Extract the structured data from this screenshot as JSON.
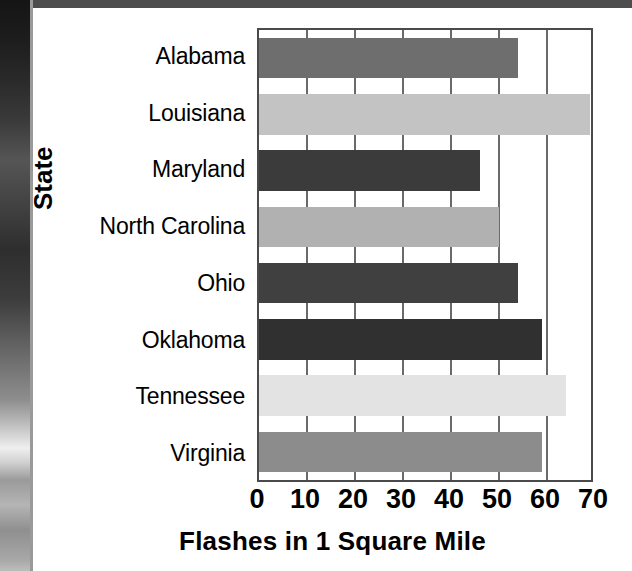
{
  "chart_data": {
    "type": "bar",
    "orientation": "horizontal",
    "title": "",
    "xlabel": "Flashes in 1 Square Mile",
    "ylabel": "State",
    "categories": [
      "Alabama",
      "Louisiana",
      "Maryland",
      "North Carolina",
      "Ohio",
      "Oklahoma",
      "Tennessee",
      "Virginia"
    ],
    "values": [
      54,
      69,
      46,
      50,
      54,
      59,
      64,
      59
    ],
    "xlim": [
      0,
      70
    ],
    "xticks": [
      0,
      10,
      20,
      30,
      40,
      50,
      60,
      70
    ],
    "xtick_labels": [
      "0",
      "10",
      "20",
      "30",
      "40",
      "50",
      "60",
      "70"
    ],
    "grid": "vertical",
    "legend": "none",
    "bar_colors": [
      "#6e6e6e",
      "#c3c3c3",
      "#3b3b3b",
      "#b1b1b1",
      "#404040",
      "#303030",
      "#e3e3e3",
      "#8c8c8c"
    ]
  },
  "figure": {
    "plot_border_color": "#4a4a4a",
    "gridline_color": "#6a6a6a",
    "background_color": "#ffffff",
    "top_band_color": "#4d4d4d",
    "photo_strip_name": "photo-edge-strip"
  }
}
